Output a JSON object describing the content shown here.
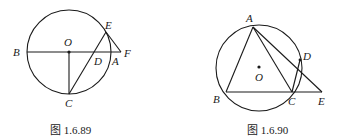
{
  "figures": [
    {
      "caption": "图 1.6.89",
      "labels": {
        "B": "B",
        "O": "O",
        "E": "E",
        "F": "F",
        "D": "D",
        "A": "A",
        "C": "C"
      },
      "description": "Circle with center O, diameter BA extended to F, radius OC perpendicular to BA, chord CE through D on BA, segment EF"
    },
    {
      "caption": "图 1.6.90",
      "labels": {
        "A": "A",
        "D": "D",
        "O": "O",
        "B": "B",
        "C": "C",
        "E": "E"
      },
      "description": "Triangle ABC inscribed in circle O, BC extended to E, AE meets circle at D, chord CD"
    }
  ]
}
